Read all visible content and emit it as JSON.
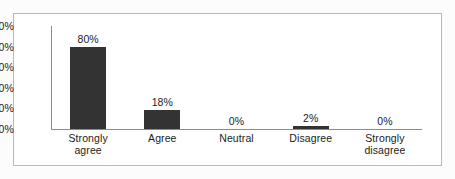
{
  "chart_data": {
    "type": "bar",
    "title": "",
    "subtitle": "",
    "xlabel": "",
    "ylabel": "",
    "ylim": [
      0,
      100
    ],
    "yticks": [
      "0%",
      "20%",
      "40%",
      "60%",
      "80%",
      "100%"
    ],
    "ytick_values": [
      0,
      20,
      40,
      60,
      80,
      100
    ],
    "grid": false,
    "legend": false,
    "legend_position": "none",
    "bar_color": "#333333",
    "axis_color": "#8c8c8c",
    "frame_color": "#b9b9b9",
    "categories": [
      "Strongly agree",
      "Agree",
      "Neutral",
      "Disagree",
      "Strongly disagree"
    ],
    "category_lines": [
      [
        "Strongly",
        "agree"
      ],
      [
        "Agree"
      ],
      [
        "Neutral"
      ],
      [
        "Disagree"
      ],
      [
        "Strongly",
        "disagree"
      ]
    ],
    "values": [
      80,
      18,
      0,
      2,
      0
    ],
    "data_labels": [
      "80%",
      "18%",
      "0%",
      "2%",
      "0%"
    ]
  }
}
